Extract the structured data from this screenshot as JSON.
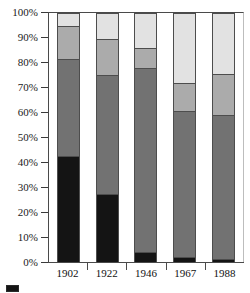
{
  "chart_data": {
    "type": "bar",
    "subtype": "stacked-percentage",
    "title": "",
    "xlabel": "",
    "ylabel": "",
    "ylim": [
      0,
      100
    ],
    "grid": false,
    "legend_position": "bottom-left",
    "categories": [
      "1902",
      "1922",
      "1946",
      "1967",
      "1988"
    ],
    "y_ticks": [
      "0%",
      "10%",
      "20%",
      "30%",
      "40%",
      "50%",
      "60%",
      "70%",
      "80%",
      "90%",
      "100%"
    ],
    "y_tick_values": [
      0,
      10,
      20,
      30,
      40,
      50,
      60,
      70,
      80,
      90,
      100
    ],
    "series": [
      {
        "name": "series-1",
        "color": "#141414",
        "values": [
          43,
          27.5,
          3.5,
          1.5,
          1
        ]
      },
      {
        "name": "series-2",
        "color": "#727272",
        "values": [
          39,
          48,
          75,
          59.5,
          58
        ]
      },
      {
        "name": "series-3",
        "color": "#ababab",
        "values": [
          13,
          14.5,
          7.5,
          11,
          16.5
        ]
      },
      {
        "name": "series-4",
        "color": "#e2e2e2",
        "values": [
          5,
          10,
          14,
          28,
          24.5
        ]
      }
    ],
    "stacks": [
      {
        "category": "1902",
        "segments": [
          {
            "series": "series-4",
            "value": 5,
            "color": "#e2e2e2"
          },
          {
            "series": "series-3",
            "value": 13,
            "color": "#ababab"
          },
          {
            "series": "series-2",
            "value": 39,
            "color": "#727272"
          },
          {
            "series": "series-1",
            "value": 43,
            "color": "#141414"
          }
        ]
      },
      {
        "category": "1922",
        "segments": [
          {
            "series": "series-4",
            "value": 10,
            "color": "#e2e2e2"
          },
          {
            "series": "series-3",
            "value": 14.5,
            "color": "#ababab"
          },
          {
            "series": "series-2",
            "value": 48,
            "color": "#727272"
          },
          {
            "series": "series-1",
            "value": 27.5,
            "color": "#141414"
          }
        ]
      },
      {
        "category": "1946",
        "segments": [
          {
            "series": "series-4",
            "value": 14,
            "color": "#e2e2e2"
          },
          {
            "series": "series-3",
            "value": 7.5,
            "color": "#ababab"
          },
          {
            "series": "series-2",
            "value": 75,
            "color": "#727272"
          },
          {
            "series": "series-1",
            "value": 3.5,
            "color": "#141414"
          }
        ]
      },
      {
        "category": "1967",
        "segments": [
          {
            "series": "series-4",
            "value": 28,
            "color": "#e2e2e2"
          },
          {
            "series": "series-3",
            "value": 11,
            "color": "#ababab"
          },
          {
            "series": "series-2",
            "value": 59.5,
            "color": "#727272"
          },
          {
            "series": "series-1",
            "value": 1.5,
            "color": "#141414"
          }
        ]
      },
      {
        "category": "1988",
        "segments": [
          {
            "series": "series-4",
            "value": 24.5,
            "color": "#e2e2e2"
          },
          {
            "series": "series-3",
            "value": 16.5,
            "color": "#ababab"
          },
          {
            "series": "series-2",
            "value": 58,
            "color": "#727272"
          },
          {
            "series": "series-1",
            "value": 1,
            "color": "#141414"
          }
        ]
      }
    ]
  },
  "legend": {
    "entries": [
      {
        "label": "",
        "color": "#141414"
      }
    ]
  },
  "colors": {
    "axis": "#4a4a4a",
    "text": "#111111",
    "background": "#ffffff",
    "segment_border": "#4d4d4d"
  }
}
